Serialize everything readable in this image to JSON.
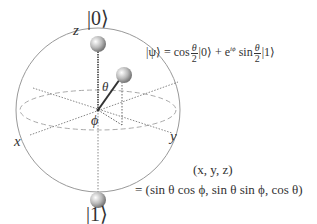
{
  "diagram": {
    "axes": {
      "z": "z",
      "x": "x",
      "y": "y"
    },
    "angles": {
      "theta": "θ",
      "phi": "ϕ"
    },
    "poles": {
      "top": "|0⟩",
      "bottom": "|1⟩"
    },
    "state_equation": {
      "lhs": "|ψ⟩ = cos",
      "frac1_num": "θ",
      "frac1_den": "2",
      "mid": "|0⟩ + e",
      "exponent": "iϕ",
      "mid2": " sin",
      "frac2_num": "θ",
      "frac2_den": "2",
      "rhs": "|1⟩"
    },
    "coordinates": {
      "line1": "(x, y, z)",
      "line2": "= (sin θ cos ϕ, sin θ sin ϕ, cos θ)"
    },
    "colors": {
      "line": "#888888",
      "vector": "#333333",
      "text": "#333333",
      "ball": "#b0b0b0"
    }
  }
}
